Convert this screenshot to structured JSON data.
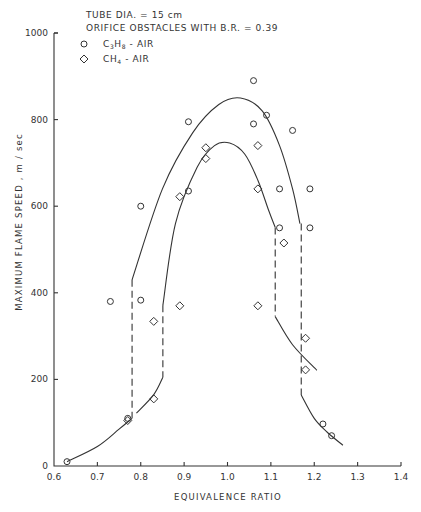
{
  "annotation": {
    "line1": "TUBE DIA. = 15 cm",
    "line2": "ORIFICE OBSTACLES WITH B.R. = 0.39",
    "legend": [
      {
        "marker": "circle",
        "label_main": "C",
        "label_sub1": "3",
        "label_mid": "H",
        "label_sub2": "8",
        "label_tail": " - AIR"
      },
      {
        "marker": "diamond",
        "label_main": "CH",
        "label_sub1": "4",
        "label_mid": "",
        "label_sub2": "",
        "label_tail": " - AIR"
      }
    ]
  },
  "axes": {
    "xlabel": "EQUIVALENCE RATIO",
    "ylabel": "MAXIMUM FLAME SPEED , m / sec",
    "xticks": [
      "0.6",
      "0.7",
      "0.8",
      "0.9",
      "1.0",
      "1.1",
      "1.2",
      "1.3",
      "1.4"
    ],
    "yticks": [
      "0",
      "200",
      "400",
      "600",
      "800",
      "1000"
    ]
  },
  "chart_data": {
    "type": "scatter",
    "xlabel": "EQUIVALENCE RATIO",
    "ylabel": "MAXIMUM FLAME SPEED, m/sec",
    "xlim": [
      0.6,
      1.4
    ],
    "ylim": [
      0,
      1000
    ],
    "xticks": [
      0.6,
      0.7,
      0.8,
      0.9,
      1.0,
      1.1,
      1.2,
      1.3,
      1.4
    ],
    "yticks": [
      0,
      200,
      400,
      600,
      800,
      1000
    ],
    "grid": false,
    "legend_position": "top-left",
    "series": [
      {
        "name": "C3H8-AIR",
        "marker": "circle",
        "points": [
          [
            0.63,
            10
          ],
          [
            0.73,
            380
          ],
          [
            0.77,
            110
          ],
          [
            0.8,
            383
          ],
          [
            0.8,
            600
          ],
          [
            0.91,
            635
          ],
          [
            0.91,
            795
          ],
          [
            1.06,
            890
          ],
          [
            1.06,
            790
          ],
          [
            1.09,
            810
          ],
          [
            1.12,
            640
          ],
          [
            1.12,
            550
          ],
          [
            1.15,
            775
          ],
          [
            1.19,
            640
          ],
          [
            1.19,
            550
          ],
          [
            1.22,
            97
          ],
          [
            1.24,
            70
          ]
        ],
        "fit_curve": {
          "upper_branch": [
            [
              0.78,
              430
            ],
            [
              0.85,
              640
            ],
            [
              0.92,
              770
            ],
            [
              0.98,
              835
            ],
            [
              1.03,
              850
            ],
            [
              1.08,
              820
            ],
            [
              1.12,
              740
            ],
            [
              1.15,
              640
            ],
            [
              1.167,
              560
            ]
          ],
          "lower_left_branch": [
            [
              0.63,
              10
            ],
            [
              0.7,
              45
            ],
            [
              0.75,
              85
            ],
            [
              0.78,
              110
            ]
          ],
          "lower_right_branch": [
            [
              1.17,
              164
            ],
            [
              1.2,
              110
            ],
            [
              1.23,
              78
            ],
            [
              1.266,
              48
            ]
          ],
          "dashed_transitions": [
            [
              [
                0.78,
                430
              ],
              [
                0.78,
                110
              ]
            ],
            [
              [
                1.17,
                560
              ],
              [
                1.17,
                164
              ]
            ]
          ]
        }
      },
      {
        "name": "CH4-AIR",
        "marker": "diamond",
        "points": [
          [
            0.77,
            105
          ],
          [
            0.83,
            155
          ],
          [
            0.83,
            334
          ],
          [
            0.89,
            370
          ],
          [
            0.89,
            622
          ],
          [
            0.95,
            710
          ],
          [
            0.95,
            735
          ],
          [
            1.07,
            740
          ],
          [
            1.07,
            640
          ],
          [
            1.07,
            370
          ],
          [
            1.13,
            515
          ],
          [
            1.18,
            295
          ],
          [
            1.18,
            222
          ]
        ],
        "fit_curve": {
          "upper_branch": [
            [
              0.851,
              371
            ],
            [
              0.88,
              560
            ],
            [
              0.93,
              690
            ],
            [
              0.97,
              740
            ],
            [
              1.005,
              746
            ],
            [
              1.04,
              720
            ],
            [
              1.07,
              660
            ],
            [
              1.095,
              590
            ],
            [
              1.11,
              551
            ]
          ],
          "lower_left_branch": [
            [
              0.79,
              122
            ],
            [
              0.83,
              165
            ],
            [
              0.851,
              205
            ]
          ],
          "lower_right_branch": [
            [
              1.11,
              345
            ],
            [
              1.15,
              280
            ],
            [
              1.206,
              221
            ]
          ],
          "dashed_transitions": [
            [
              [
                0.851,
                371
              ],
              [
                0.851,
                205
              ]
            ],
            [
              [
                1.11,
                551
              ],
              [
                1.11,
                345
              ]
            ]
          ]
        }
      }
    ]
  }
}
